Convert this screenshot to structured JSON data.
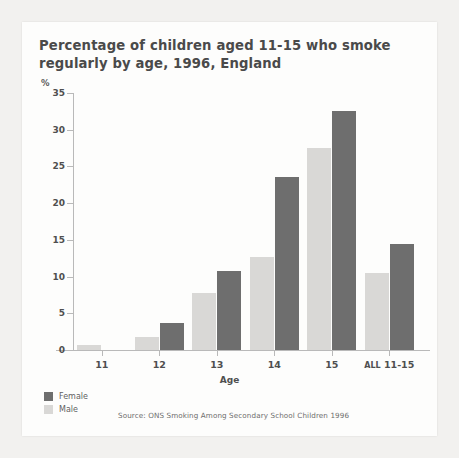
{
  "chart_data": {
    "type": "bar",
    "title": "Percentage of children aged 11-15 who smoke regularly by age, 1996, England",
    "unit_label": "%",
    "xlabel": "Age",
    "ylabel": "",
    "ylim": [
      0,
      35
    ],
    "yticks": [
      0,
      5,
      10,
      15,
      20,
      25,
      30,
      35
    ],
    "grid": false,
    "legend_position": "bottom-left",
    "categories": [
      "11",
      "12",
      "13",
      "14",
      "15",
      "All 11-15"
    ],
    "series": [
      {
        "name": "Female",
        "color": "#6e6e6e",
        "values": [
          0,
          3.7,
          10.7,
          23.5,
          32.5,
          14.4
        ]
      },
      {
        "name": "Male",
        "color": "#d9d8d6",
        "values": [
          0.7,
          1.8,
          7.8,
          12.7,
          27.5,
          10.5
        ]
      }
    ],
    "source": "Source: ONS Smoking Among Secondary School Children 1996"
  },
  "colors": {
    "female": "#6e6e6e",
    "male": "#d9d8d6",
    "axis": "#b9b9b9",
    "text": "#4f4f4f",
    "page_background": "#f2f1ef",
    "card_background": "#fdfdfc"
  }
}
